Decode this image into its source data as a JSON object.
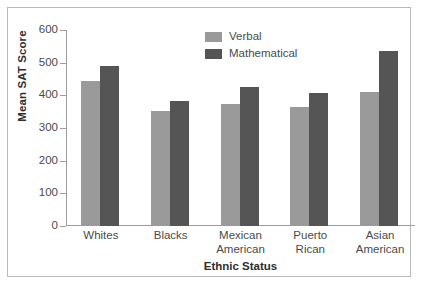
{
  "chart_data": {
    "type": "bar",
    "title": "",
    "xlabel": "Ethnic Status",
    "ylabel": "Mean SAT Score",
    "ylim": [
      0,
      600
    ],
    "yticks": [
      0,
      100,
      200,
      300,
      400,
      500,
      600
    ],
    "ytick_labels": [
      "0",
      "100",
      "200",
      "300",
      "400",
      "500",
      "600"
    ],
    "grid": false,
    "legend_position": "top-center",
    "categories": [
      "Whites",
      "Blacks",
      "Mexican American",
      "Puerto Rican",
      "Asian American"
    ],
    "category_lines": [
      [
        "Whites"
      ],
      [
        "Blacks"
      ],
      [
        "Mexican",
        "American"
      ],
      [
        "Puerto",
        "Rican"
      ],
      [
        "Asian",
        "American"
      ]
    ],
    "series": [
      {
        "name": "Verbal",
        "color": "#9a9a9a",
        "values": [
          445,
          352,
          372,
          365,
          410
        ]
      },
      {
        "name": "Mathematical",
        "color": "#555555",
        "values": [
          490,
          383,
          425,
          408,
          535
        ]
      }
    ]
  },
  "colors": {
    "verbal": "#9a9a9a",
    "mathematical": "#555555",
    "axis": "#9d9d9d",
    "frame": "#b9b9b9",
    "text": "#4a4a4a",
    "background": "#ffffff"
  }
}
